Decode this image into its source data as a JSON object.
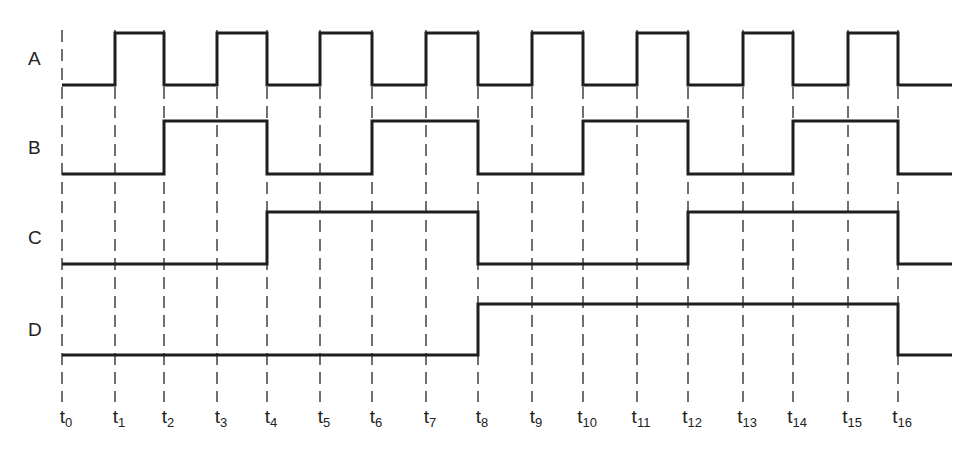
{
  "diagram": {
    "type": "timing-diagram",
    "signals": [
      {
        "name": "A",
        "high_y": 33,
        "low_y": 85,
        "values": [
          0,
          1,
          0,
          1,
          0,
          1,
          0,
          1,
          0,
          1,
          0,
          1,
          0,
          1,
          0,
          1,
          0
        ]
      },
      {
        "name": "B",
        "high_y": 121,
        "low_y": 174,
        "values": [
          0,
          0,
          1,
          1,
          0,
          0,
          1,
          1,
          0,
          0,
          1,
          1,
          0,
          0,
          1,
          1,
          0
        ]
      },
      {
        "name": "C",
        "high_y": 212,
        "low_y": 264,
        "values": [
          0,
          0,
          0,
          0,
          1,
          1,
          1,
          1,
          0,
          0,
          0,
          0,
          1,
          1,
          1,
          1,
          0
        ]
      },
      {
        "name": "D",
        "high_y": 304,
        "low_y": 355,
        "values": [
          0,
          0,
          0,
          0,
          0,
          0,
          0,
          0,
          1,
          1,
          1,
          1,
          1,
          1,
          1,
          1,
          0
        ]
      }
    ],
    "time_marks": [
      {
        "base": "t",
        "sub": "0",
        "x": 62
      },
      {
        "base": "t",
        "sub": "1",
        "x": 115
      },
      {
        "base": "t",
        "sub": "2",
        "x": 164
      },
      {
        "base": "t",
        "sub": "3",
        "x": 217
      },
      {
        "base": "t",
        "sub": "4",
        "x": 267
      },
      {
        "base": "t",
        "sub": "5",
        "x": 320
      },
      {
        "base": "t",
        "sub": "6",
        "x": 372
      },
      {
        "base": "t",
        "sub": "7",
        "x": 426
      },
      {
        "base": "t",
        "sub": "8",
        "x": 478
      },
      {
        "base": "t",
        "sub": "9",
        "x": 532
      },
      {
        "base": "t",
        "sub": "10",
        "x": 583
      },
      {
        "base": "t",
        "sub": "11",
        "x": 637
      },
      {
        "base": "t",
        "sub": "12",
        "x": 688
      },
      {
        "base": "t",
        "sub": "13",
        "x": 743
      },
      {
        "base": "t",
        "sub": "14",
        "x": 793
      },
      {
        "base": "t",
        "sub": "15",
        "x": 848
      },
      {
        "base": "t",
        "sub": "16",
        "x": 898
      }
    ],
    "end_x": 952,
    "line_color": "#1e1e1e",
    "dash_color": "#333333"
  }
}
